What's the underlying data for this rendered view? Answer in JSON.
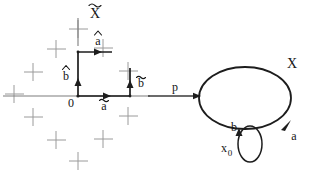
{
  "figure": {
    "background_color": "#ffffff",
    "ink_color": "#1d1d1d",
    "lattice_color": "#9a9a9a",
    "panels": [
      {
        "id": "lattice-panel",
        "name": "universal-cover-lattice",
        "title": "X̃",
        "title_base": "X",
        "title_accent": "tilde",
        "origin_label": "0",
        "vectors": [
          {
            "name": "a-tilde",
            "base": "a",
            "accent": "tilde",
            "label": "ã",
            "direction": "right",
            "from": "origin"
          },
          {
            "name": "b-hat",
            "base": "b",
            "accent": "hat",
            "label": "b̂",
            "direction": "up",
            "from": "origin"
          },
          {
            "name": "a-hat",
            "base": "a",
            "accent": "hat",
            "label": "â",
            "direction": "right",
            "from": "upper-node"
          },
          {
            "name": "b-bar",
            "base": "b",
            "accent": "bar",
            "label": "b̄",
            "direction": "up",
            "from": "right-node"
          }
        ]
      },
      {
        "id": "loop-panel",
        "name": "base-space-loops",
        "space_label": "X",
        "covering_map_label": "p",
        "basepoint_label": "x₀",
        "basepoint_base": "x",
        "basepoint_subscript": "0",
        "outer_loop_label": "a",
        "inner_loop_label": "b"
      }
    ]
  }
}
